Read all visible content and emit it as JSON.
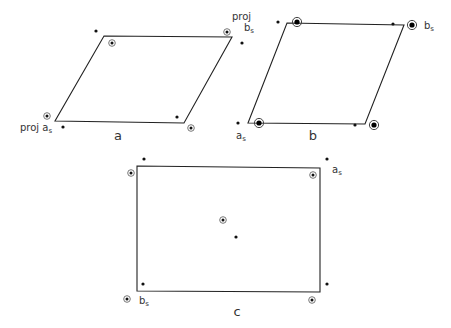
{
  "panels": [
    {
      "id": "a",
      "caption": "a",
      "shape": [
        [
          104,
          36
        ],
        [
          232,
          37
        ],
        [
          184,
          123
        ],
        [
          55,
          121
        ]
      ],
      "dots": [
        [
          96,
          31
        ],
        [
          242,
          43
        ],
        [
          63,
          127
        ],
        [
          177,
          117
        ]
      ],
      "circled": [
        [
          112,
          43
        ],
        [
          227,
          32
        ],
        [
          47,
          116
        ],
        [
          191,
          128
        ]
      ],
      "labels": [
        {
          "text": "proj a",
          "sub": "s",
          "x": 20,
          "y": 131
        },
        {
          "text": "proj",
          "sub": "",
          "x": 232,
          "y": 20
        },
        {
          "text": "b",
          "sub": "s",
          "x": 244,
          "y": 31
        }
      ]
    },
    {
      "id": "b",
      "caption": "b",
      "shape": [
        [
          287,
          23
        ],
        [
          404,
          25
        ],
        [
          365,
          124
        ],
        [
          248,
          123
        ]
      ],
      "dots": [
        [
          278,
          22
        ],
        [
          393,
          24
        ],
        [
          238,
          123
        ],
        [
          355,
          125
        ]
      ],
      "big_circled": [
        [
          297,
          22
        ],
        [
          412,
          25
        ],
        [
          259,
          123
        ],
        [
          374,
          125
        ]
      ],
      "labels": [
        {
          "text": "b",
          "sub": "s",
          "x": 424,
          "y": 29
        },
        {
          "text": "a",
          "sub": "s",
          "x": 236,
          "y": 139
        }
      ]
    },
    {
      "id": "c",
      "caption": "c",
      "shape": [
        [
          137,
          166
        ],
        [
          320,
          168
        ],
        [
          320,
          292
        ],
        [
          137,
          291
        ]
      ],
      "dots": [
        [
          144,
          159
        ],
        [
          327,
          159
        ],
        [
          236,
          237
        ],
        [
          143,
          284
        ],
        [
          327,
          284
        ]
      ],
      "circled": [
        [
          131,
          173
        ],
        [
          313,
          175
        ],
        [
          223,
          220
        ],
        [
          127,
          299
        ],
        [
          312,
          300
        ]
      ],
      "labels": [
        {
          "text": "a",
          "sub": "s",
          "x": 332,
          "y": 173
        },
        {
          "text": "b",
          "sub": "s",
          "x": 139,
          "y": 304
        }
      ]
    }
  ],
  "captions": [
    {
      "text": "a",
      "x": 118,
      "y": 140
    },
    {
      "text": "b",
      "x": 313,
      "y": 140
    },
    {
      "text": "c",
      "x": 237,
      "y": 316
    }
  ]
}
